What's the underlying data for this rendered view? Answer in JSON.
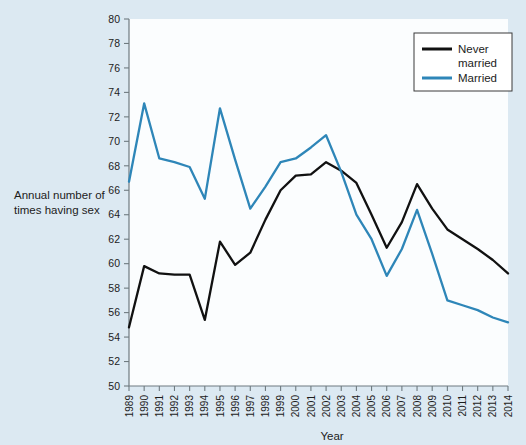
{
  "chart_data": {
    "type": "line",
    "title": "",
    "xlabel": "Year",
    "ylabel": "Annual number of times having sex",
    "ylim": [
      50,
      80
    ],
    "ytick_step": 2,
    "yticks": [
      50,
      52,
      54,
      56,
      58,
      60,
      62,
      64,
      66,
      68,
      70,
      72,
      74,
      76,
      78,
      80
    ],
    "grid": false,
    "legend_position": "top-right",
    "categories": [
      "1989",
      "1990",
      "1991",
      "1992",
      "1993",
      "1994",
      "1995",
      "1996",
      "1997",
      "1998",
      "1999",
      "2000",
      "2001",
      "2002",
      "2003",
      "2004",
      "2005",
      "2006",
      "2007",
      "2008",
      "2009",
      "2010",
      "2011",
      "2012",
      "2013",
      "2014"
    ],
    "series": [
      {
        "name": "Never married",
        "color": "#111111",
        "values": [
          54.8,
          59.8,
          59.2,
          59.1,
          59.1,
          55.4,
          61.8,
          59.9,
          60.9,
          63.6,
          66.0,
          67.2,
          67.3,
          68.3,
          67.6,
          66.6,
          64.0,
          61.3,
          63.4,
          66.5,
          64.5,
          62.8,
          62.0,
          61.2,
          60.3,
          59.2
        ]
      },
      {
        "name": "Married",
        "color": "#2e86b8",
        "values": [
          66.7,
          73.1,
          68.6,
          68.3,
          67.9,
          65.3,
          72.7,
          68.5,
          64.5,
          66.3,
          68.3,
          68.6,
          69.5,
          70.5,
          67.5,
          64.0,
          62.0,
          59.0,
          61.2,
          64.4,
          60.8,
          57.0,
          56.6,
          56.2,
          55.6,
          55.2
        ]
      }
    ]
  },
  "legend": {
    "items": [
      {
        "label_line1": "Never",
        "label_line2": "married"
      },
      {
        "label_line1": "Married",
        "label_line2": ""
      }
    ]
  },
  "axis": {
    "y_title_line1": "Annual number of",
    "y_title_line2": "times having sex",
    "x_title": "Year"
  }
}
